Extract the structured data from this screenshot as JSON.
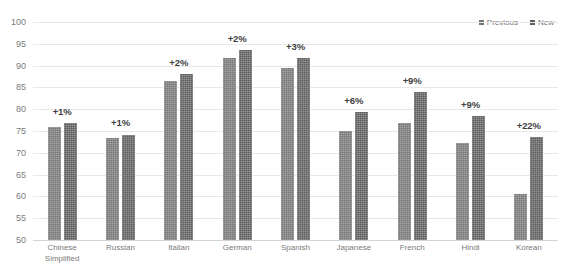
{
  "chart_data": {
    "type": "bar",
    "title": "",
    "xlabel": "",
    "ylabel": "",
    "ylim": [
      50,
      100
    ],
    "ytick_step": 5,
    "grid": true,
    "legend_position": "top-right",
    "categories": [
      "Chinese Simplified",
      "Russian",
      "Italian",
      "German",
      "Spanish",
      "Japanese",
      "French",
      "Hindi",
      "Korean"
    ],
    "ytick_labels": [
      "100",
      "95",
      "90",
      "85",
      "80",
      "75",
      "70",
      "65",
      "60",
      "55",
      "50"
    ],
    "series": [
      {
        "name": "Previous",
        "color": "#767676",
        "values": [
          76.0,
          73.3,
          86.4,
          91.8,
          89.4,
          75.1,
          76.8,
          72.2,
          60.5
        ]
      },
      {
        "name": "New",
        "color": "#5e5e5e",
        "values": [
          76.8,
          74.2,
          88.0,
          93.5,
          91.8,
          79.4,
          84.0,
          78.4,
          73.6
        ]
      }
    ],
    "annotations": [
      "+1%",
      "+1%",
      "+2%",
      "+2%",
      "+3%",
      "+6%",
      "+9%",
      "+9%",
      "+22%"
    ]
  },
  "legend": {
    "entries": [
      {
        "label": "Previous"
      },
      {
        "label": "New"
      }
    ]
  }
}
